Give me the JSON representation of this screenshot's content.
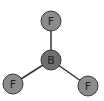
{
  "molecule": {
    "name": "BF3",
    "colors": {
      "bond": "#333333",
      "fluorine_fill": "#8c8c8c",
      "boron_fill": "#6e6e6e",
      "atom_stroke": "#3a3a3a",
      "label": "#222222"
    },
    "atoms": [
      {
        "label": "F",
        "x": 51,
        "y": 21,
        "r": 10
      },
      {
        "label": "B",
        "x": 51,
        "y": 60,
        "r": 10
      },
      {
        "label": "F",
        "x": 13,
        "y": 84,
        "r": 10
      },
      {
        "label": "F",
        "x": 88,
        "y": 86,
        "r": 10
      }
    ],
    "bonds": [
      [
        1,
        0
      ],
      [
        1,
        2
      ],
      [
        1,
        3
      ]
    ]
  }
}
